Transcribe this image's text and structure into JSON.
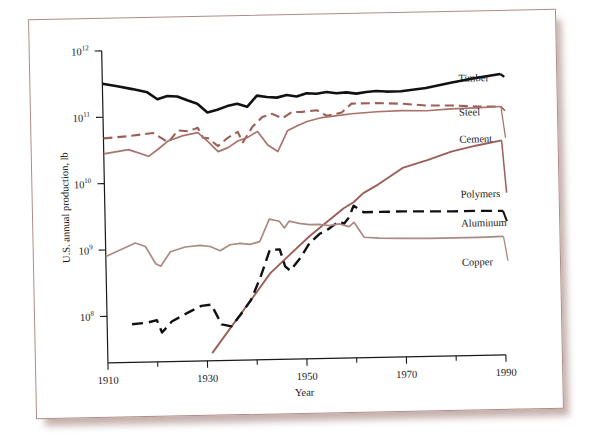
{
  "figure": {
    "kind": "line-chart-photograph",
    "background_color": "#ffffff",
    "card_color": "#ffffff",
    "card_border_color": "#b08c85",
    "shadow_color": "#b09692"
  },
  "axes": {
    "x_title": "Year",
    "y_title": "U.S. annual production, lb",
    "x_tick_labels": [
      "1910",
      "1930",
      "1950",
      "1970",
      "1990"
    ],
    "x_minor_ticks": [
      "1920",
      "1940",
      "1960",
      "1980"
    ],
    "y_tick_labels": [
      "10",
      "10",
      "10",
      "10",
      "10"
    ],
    "y_tick_exponents": [
      "8",
      "9",
      "10",
      "11",
      "12"
    ]
  },
  "chart_data": {
    "type": "line",
    "title": "",
    "subtitle": "",
    "xlabel": "Year",
    "ylabel": "U.S. annual production, lb",
    "xlim": [
      1910,
      1990
    ],
    "ylim": [
      20000000,
      1000000000000
    ],
    "yscale": "log",
    "grid": false,
    "legend_position": "right-inline-labels",
    "x_ticks": [
      1910,
      1930,
      1950,
      1970,
      1990
    ],
    "x_minor_ticks": [
      1920,
      1940,
      1960,
      1980
    ],
    "y_ticks": [
      100000000,
      1000000000,
      10000000000,
      100000000000,
      1000000000000
    ],
    "y_tick_text": [
      "10^8",
      "10^9",
      "10^10",
      "10^11",
      "10^12"
    ],
    "series": [
      {
        "name": "Timber",
        "color": "#111111",
        "style": "solid",
        "width": 2.6,
        "label_x": 1990,
        "x": [
          1910,
          1913,
          1916,
          1919,
          1921,
          1923,
          1925,
          1927,
          1929,
          1931,
          1933,
          1935,
          1937,
          1939,
          1941,
          1943,
          1945,
          1947,
          1949,
          1951,
          1953,
          1955,
          1957,
          1959,
          1961,
          1963,
          1965,
          1967,
          1970,
          1975,
          1980,
          1985,
          1990
        ],
        "y": [
          320000000000.0,
          290000000000.0,
          260000000000.0,
          230000000000.0,
          180000000000.0,
          200000000000.0,
          195000000000.0,
          170000000000.0,
          150000000000.0,
          110000000000.0,
          120000000000.0,
          135000000000.0,
          145000000000.0,
          130000000000.0,
          190000000000.0,
          180000000000.0,
          175000000000.0,
          190000000000.0,
          180000000000.0,
          200000000000.0,
          195000000000.0,
          205000000000.0,
          195000000000.0,
          200000000000.0,
          190000000000.0,
          200000000000.0,
          205000000000.0,
          200000000000.0,
          200000000000.0,
          220000000000.0,
          260000000000.0,
          300000000000.0,
          340000000000.0
        ]
      },
      {
        "name": "Steel",
        "color": "#9c5f57",
        "style": "dashed",
        "width": 2.1,
        "label_x": 1990,
        "x": [
          1910,
          1915,
          1920,
          1923,
          1925,
          1927,
          1929,
          1930,
          1931,
          1933,
          1935,
          1937,
          1938,
          1940,
          1942,
          1944,
          1946,
          1948,
          1950,
          1953,
          1955,
          1958,
          1960,
          1965,
          1970,
          1975,
          1980,
          1985,
          1990
        ],
        "y": [
          48000000000.0,
          51000000000.0,
          56000000000.0,
          40000000000.0,
          60000000000.0,
          58000000000.0,
          65000000000.0,
          46000000000.0,
          45000000000.0,
          34000000000.0,
          45000000000.0,
          55000000000.0,
          38000000000.0,
          65000000000.0,
          90000000000.0,
          100000000000.0,
          85000000000.0,
          105000000000.0,
          105000000000.0,
          110000000000.0,
          90000000000.0,
          100000000000.0,
          135000000000.0,
          135000000000.0,
          130000000000.0,
          120000000000.0,
          118000000000.0,
          112000000000.0,
          110000000000.0
        ]
      },
      {
        "name": "Cement",
        "color": "#a9736c",
        "style": "solid",
        "width": 1.7,
        "label_x": 1990,
        "x": [
          1910,
          1915,
          1919,
          1921,
          1923,
          1926,
          1929,
          1931,
          1933,
          1935,
          1937,
          1939,
          1941,
          1943,
          1945,
          1947,
          1949,
          1951,
          1954,
          1957,
          1960,
          1965,
          1970,
          1975,
          1980,
          1985,
          1990
        ],
        "y": [
          28000000000.0,
          32000000000.0,
          25000000000.0,
          32000000000.0,
          42000000000.0,
          50000000000.0,
          55000000000.0,
          40000000000.0,
          28000000000.0,
          32000000000.0,
          40000000000.0,
          45000000000.0,
          55000000000.0,
          34000000000.0,
          27000000000.0,
          55000000000.0,
          65000000000.0,
          75000000000.0,
          85000000000.0,
          90000000000.0,
          95000000000.0,
          100000000000.0,
          102000000000.0,
          100000000000.0,
          105000000000.0,
          107000000000.0,
          110000000000.0
        ]
      },
      {
        "name": "Polymers",
        "color": "#9c5f57",
        "style": "solid",
        "width": 1.9,
        "label_x": 1990,
        "x": [
          1931,
          1935,
          1939,
          1943,
          1947,
          1951,
          1955,
          1958,
          1960,
          1962,
          1965,
          1970,
          1975,
          1980,
          1985,
          1990
        ],
        "y": [
          26000000.0,
          65000000.0,
          160000000.0,
          400000000.0,
          750000000.0,
          1400000000.0,
          2400000000.0,
          3600000000.0,
          4400000000.0,
          6000000000.0,
          8000000000.0,
          14000000000.0,
          18000000000.0,
          24000000000.0,
          29000000000.0,
          34000000000.0
        ]
      },
      {
        "name": "Aluminum",
        "color": "#111111",
        "style": "dashed",
        "width": 2.4,
        "label_x": 1990,
        "x": [
          1915,
          1918,
          1920,
          1921,
          1923,
          1926,
          1929,
          1931,
          1933,
          1935,
          1937,
          1939,
          1941,
          1943,
          1945,
          1946,
          1947,
          1949,
          1951,
          1953,
          1955,
          1957,
          1958,
          1959,
          1960,
          1962,
          1965,
          1970,
          1975,
          1980,
          1985,
          1990
        ],
        "y": [
          75000000.0,
          78000000.0,
          85000000.0,
          55000000.0,
          80000000.0,
          105000000.0,
          135000000.0,
          140000000.0,
          70000000.0,
          65000000.0,
          100000000.0,
          160000000.0,
          350000000.0,
          900000000.0,
          900000000.0,
          500000000.0,
          430000000.0,
          650000000.0,
          1100000000.0,
          1500000000.0,
          1800000000.0,
          2300000000.0,
          2100000000.0,
          2600000000.0,
          3900000000.0,
          3100000000.0,
          3100000000.0,
          3100000000.0,
          3050000000.0,
          3000000000.0,
          3000000000.0,
          2950000000.0
        ]
      },
      {
        "name": "Copper",
        "color": "#ab8a84",
        "style": "solid",
        "width": 1.7,
        "label_x": 1990,
        "x": [
          1910,
          1913,
          1916,
          1918,
          1920,
          1921,
          1923,
          1926,
          1929,
          1931,
          1933,
          1935,
          1937,
          1939,
          1941,
          1943,
          1945,
          1946,
          1947,
          1949,
          1951,
          1953,
          1955,
          1957,
          1959,
          1960,
          1962,
          1965,
          1970,
          1975,
          1980,
          1985,
          1990
        ],
        "y": [
          800000000.0,
          1000000000.0,
          1250000000.0,
          1100000000.0,
          600000000.0,
          550000000.0,
          900000000.0,
          1050000000.0,
          1100000000.0,
          1050000000.0,
          900000000.0,
          1100000000.0,
          1150000000.0,
          1100000000.0,
          1200000000.0,
          2600000000.0,
          2400000000.0,
          1900000000.0,
          2400000000.0,
          2200000000.0,
          2100000000.0,
          2100000000.0,
          2000000000.0,
          2100000000.0,
          1900000000.0,
          2200000000.0,
          1300000000.0,
          1250000000.0,
          1220000000.0,
          1200000000.0,
          1200000000.0,
          1200000000.0,
          1220000000.0
        ]
      }
    ]
  },
  "series_labels": {
    "timber": "Timber",
    "steel": "Steel",
    "cement": "Cement",
    "polymers": "Polymers",
    "aluminum": "Aluminum",
    "copper": "Copper"
  }
}
